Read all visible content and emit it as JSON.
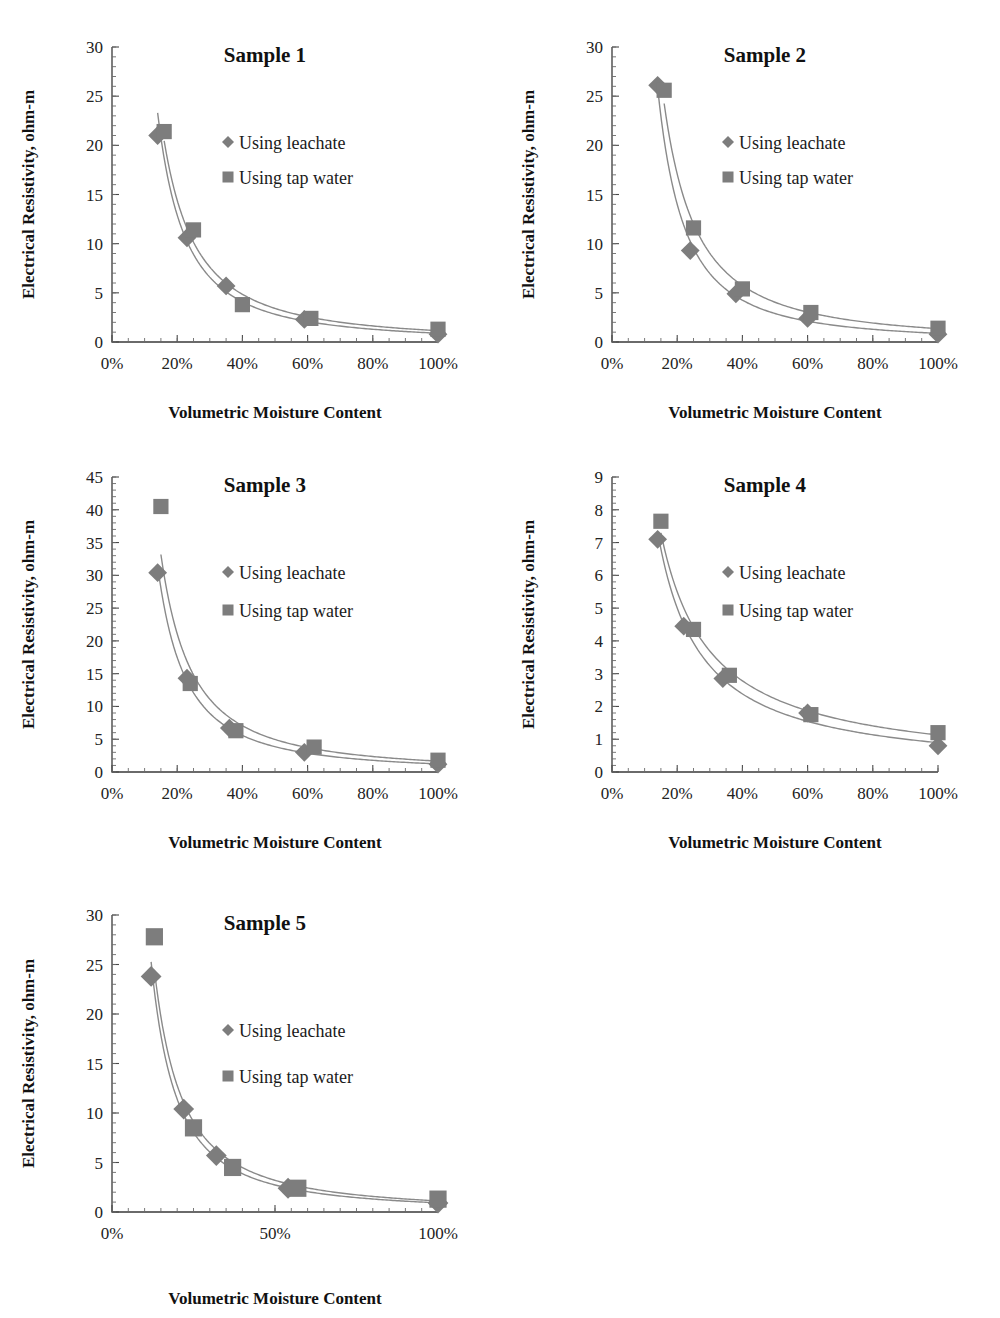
{
  "figure": {
    "panel_count": 5,
    "marker_color": "#7d7d7d",
    "line_color": "#8a8a8a",
    "axis_color": "#3a3a3a"
  },
  "legend": {
    "leachate_label": "Using leachate",
    "tapwater_label": "Using tap water",
    "leachate_marker": "diamond-marker-icon",
    "tapwater_marker": "square-marker-icon"
  },
  "axis_titles": {
    "y": "Electrical Resistivity, ohm-m",
    "x": "Volumetric Moisture Content"
  },
  "chart_data": [
    {
      "type": "scatter",
      "title": "Sample 1",
      "xlabel": "Volumetric Moisture Content",
      "ylabel": "Electrical Resistivity, ohm-m",
      "xlim": [
        0,
        100
      ],
      "ylim": [
        0,
        30
      ],
      "xticks": [
        0,
        20,
        40,
        60,
        80,
        100
      ],
      "xticklabels": [
        "0%",
        "20%",
        "40%",
        "60%",
        "80%",
        "100%"
      ],
      "yticks": [
        0,
        5,
        10,
        15,
        20,
        25,
        30
      ],
      "yticklabels": [
        "0",
        "5",
        "10",
        "15",
        "20",
        "25",
        "30"
      ],
      "grid": false,
      "legend_position": "upper-right-inside",
      "series": [
        {
          "name": "Using leachate",
          "marker": "diamond",
          "x": [
            14,
            23,
            35,
            59,
            100
          ],
          "y": [
            21.0,
            10.6,
            5.7,
            2.3,
            0.8
          ]
        },
        {
          "name": "Using tap water",
          "marker": "square",
          "x": [
            16,
            25,
            40,
            61,
            100
          ],
          "y": [
            21.4,
            11.4,
            3.8,
            2.4,
            1.3
          ]
        }
      ]
    },
    {
      "type": "scatter",
      "title": "Sample 2",
      "xlabel": "Volumetric Moisture Content",
      "ylabel": "Electrical Resistivity, ohm-m",
      "xlim": [
        0,
        100
      ],
      "ylim": [
        0,
        30
      ],
      "xticks": [
        0,
        20,
        40,
        60,
        80,
        100
      ],
      "xticklabels": [
        "0%",
        "20%",
        "40%",
        "60%",
        "80%",
        "100%"
      ],
      "yticks": [
        0,
        5,
        10,
        15,
        20,
        25,
        30
      ],
      "yticklabels": [
        "0",
        "5",
        "10",
        "15",
        "20",
        "25",
        "30"
      ],
      "grid": false,
      "legend_position": "upper-right-inside",
      "series": [
        {
          "name": "Using leachate",
          "marker": "diamond",
          "x": [
            14,
            24,
            38,
            60,
            100
          ],
          "y": [
            26.1,
            9.3,
            4.9,
            2.4,
            0.8
          ]
        },
        {
          "name": "Using tap water",
          "marker": "square",
          "x": [
            16,
            25,
            40,
            61,
            100
          ],
          "y": [
            25.6,
            11.6,
            5.4,
            3.0,
            1.4
          ]
        }
      ]
    },
    {
      "type": "scatter",
      "title": "Sample 3",
      "xlabel": "Volumetric Moisture Content",
      "ylabel": "Electrical Resistivity, ohm-m",
      "xlim": [
        0,
        100
      ],
      "ylim": [
        0,
        45
      ],
      "xticks": [
        0,
        20,
        40,
        60,
        80,
        100
      ],
      "xticklabels": [
        "0%",
        "20%",
        "40%",
        "60%",
        "80%",
        "100%"
      ],
      "yticks": [
        0,
        5,
        10,
        15,
        20,
        25,
        30,
        35,
        40,
        45
      ],
      "yticklabels": [
        "0",
        "5",
        "10",
        "15",
        "20",
        "25",
        "30",
        "35",
        "40",
        "45"
      ],
      "grid": false,
      "legend_position": "upper-right-inside",
      "series": [
        {
          "name": "Using leachate",
          "marker": "diamond",
          "x": [
            14,
            23,
            36,
            59,
            100
          ],
          "y": [
            30.4,
            14.3,
            6.7,
            3.0,
            1.2
          ]
        },
        {
          "name": "Using tap water",
          "marker": "square",
          "x": [
            15,
            24,
            38,
            62,
            100
          ],
          "y": [
            40.5,
            13.5,
            6.3,
            3.8,
            1.8
          ]
        }
      ]
    },
    {
      "type": "scatter",
      "title": "Sample 4",
      "xlabel": "Volumetric Moisture Content",
      "ylabel": "Electrical Resistivity, ohm-m",
      "xlim": [
        0,
        100
      ],
      "ylim": [
        0,
        9
      ],
      "xticks": [
        0,
        20,
        40,
        60,
        80,
        100
      ],
      "xticklabels": [
        "0%",
        "20%",
        "40%",
        "60%",
        "80%",
        "100%"
      ],
      "yticks": [
        0,
        1,
        2,
        3,
        4,
        5,
        6,
        7,
        8,
        9
      ],
      "yticklabels": [
        "0",
        "1",
        "2",
        "3",
        "4",
        "5",
        "6",
        "7",
        "8",
        "9"
      ],
      "grid": false,
      "legend_position": "upper-right-inside",
      "series": [
        {
          "name": "Using leachate",
          "marker": "diamond",
          "x": [
            14,
            22,
            34,
            60,
            100
          ],
          "y": [
            7.1,
            4.45,
            2.85,
            1.8,
            0.8
          ]
        },
        {
          "name": "Using tap water",
          "marker": "square",
          "x": [
            15,
            25,
            36,
            61,
            100
          ],
          "y": [
            7.65,
            4.35,
            2.95,
            1.75,
            1.2
          ]
        }
      ]
    },
    {
      "type": "scatter",
      "title": "Sample 5",
      "xlabel": "Volumetric Moisture Content",
      "ylabel": "Electrical Resistivity, ohm-m",
      "xlim": [
        0,
        100
      ],
      "ylim": [
        0,
        30
      ],
      "xticks": [
        0,
        50,
        100
      ],
      "xticklabels": [
        "0%",
        "50%",
        "100%"
      ],
      "yticks": [
        0,
        5,
        10,
        15,
        20,
        25,
        30
      ],
      "yticklabels": [
        "0",
        "5",
        "10",
        "15",
        "20",
        "25",
        "30"
      ],
      "grid": false,
      "legend_position": "middle-right-inside",
      "series": [
        {
          "name": "Using leachate",
          "marker": "diamond",
          "x": [
            12,
            22,
            32,
            54,
            100
          ],
          "y": [
            23.8,
            10.4,
            5.7,
            2.4,
            0.9
          ]
        },
        {
          "name": "Using tap water",
          "marker": "square",
          "x": [
            13,
            25,
            37,
            57,
            100
          ],
          "y": [
            27.8,
            8.5,
            4.5,
            2.4,
            1.3
          ]
        }
      ]
    }
  ]
}
